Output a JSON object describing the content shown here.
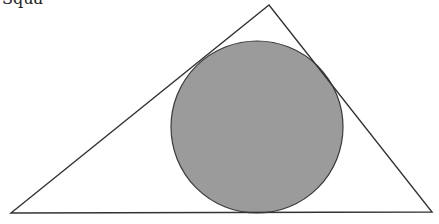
{
  "figure": {
    "width": 439,
    "height": 224,
    "background": "#ffffff",
    "clipped_text": "Squa",
    "triangle": {
      "label": "triangle",
      "points": "11,213 269,5 432,212",
      "stroke": "#333333",
      "stroke_width": 1.4,
      "fill": "none"
    },
    "incircle": {
      "label": "inscribed circle",
      "cx": 257,
      "cy": 127,
      "r": 86,
      "fill": "#9b9b9b",
      "stroke": "#3a3a3a",
      "stroke_width": 1.2
    }
  }
}
